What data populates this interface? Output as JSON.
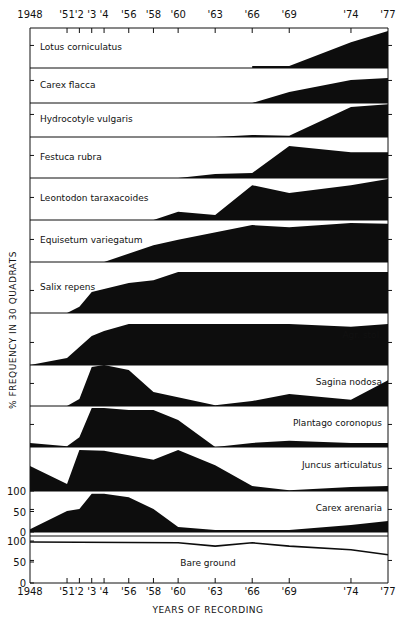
{
  "chart_data": {
    "type": "area",
    "title": "",
    "xlabel": "YEARS OF RECORDING",
    "ylabel": "% FREQUENCY IN 30 QUADRATS",
    "x_ticks": [
      {
        "year": 1948,
        "label": "1948"
      },
      {
        "year": 1951,
        "label": "'51"
      },
      {
        "year": 1952,
        "label": "'2"
      },
      {
        "year": 1953,
        "label": "'3"
      },
      {
        "year": 1954,
        "label": "'4"
      },
      {
        "year": 1956,
        "label": "'56"
      },
      {
        "year": 1958,
        "label": "'58"
      },
      {
        "year": 1960,
        "label": "'60"
      },
      {
        "year": 1963,
        "label": "'63"
      },
      {
        "year": 1966,
        "label": "'66"
      },
      {
        "year": 1969,
        "label": "'69"
      },
      {
        "year": 1974,
        "label": "'74"
      },
      {
        "year": 1977,
        "label": "'77"
      }
    ],
    "xlim": [
      1948,
      1977
    ],
    "band_ylim": [
      0,
      100
    ],
    "y_scale_labels": [
      "100",
      "50",
      "0"
    ],
    "series": [
      {
        "name": "Lotus corniculatus",
        "label_pos": "left",
        "style": "fill",
        "points": [
          [
            1966,
            5
          ],
          [
            1969,
            5
          ],
          [
            1974,
            63
          ],
          [
            1977,
            90
          ]
        ]
      },
      {
        "name": "Carex flacca",
        "label_pos": "left",
        "style": "fill",
        "points": [
          [
            1966,
            0
          ],
          [
            1969,
            27
          ],
          [
            1974,
            56
          ],
          [
            1977,
            61
          ]
        ]
      },
      {
        "name": "Hydrocotyle vulgaris",
        "label_pos": "left",
        "style": "fill",
        "points": [
          [
            1963,
            0
          ],
          [
            1966,
            5
          ],
          [
            1969,
            3
          ],
          [
            1974,
            73
          ],
          [
            1977,
            80
          ]
        ]
      },
      {
        "name": "Festuca rubra",
        "label_pos": "left",
        "style": "fill",
        "points": [
          [
            1960,
            0
          ],
          [
            1963,
            10
          ],
          [
            1966,
            12
          ],
          [
            1969,
            78
          ],
          [
            1974,
            63
          ],
          [
            1977,
            63
          ]
        ]
      },
      {
        "name": "Leontodon taraxacoides",
        "label_pos": "left",
        "style": "fill",
        "points": [
          [
            1958,
            0
          ],
          [
            1960,
            20
          ],
          [
            1963,
            12
          ],
          [
            1966,
            85
          ],
          [
            1969,
            66
          ],
          [
            1974,
            85
          ],
          [
            1977,
            100
          ]
        ]
      },
      {
        "name": "Equisetum variegatum",
        "label_pos": "left",
        "style": "fill",
        "points": [
          [
            1954,
            0
          ],
          [
            1958,
            41
          ],
          [
            1960,
            54
          ],
          [
            1966,
            90
          ],
          [
            1969,
            85
          ],
          [
            1974,
            95
          ],
          [
            1977,
            93
          ]
        ]
      },
      {
        "name": "Salix repens",
        "label_pos": "left",
        "style": "fill",
        "points": [
          [
            1951,
            0
          ],
          [
            1952,
            15
          ],
          [
            1953,
            51
          ],
          [
            1956,
            73
          ],
          [
            1958,
            80
          ],
          [
            1960,
            100
          ],
          [
            1977,
            100
          ]
        ]
      },
      {
        "name": "Agr. stol.",
        "label_pos": "right",
        "style": "fill",
        "points": [
          [
            1948,
            0
          ],
          [
            1951,
            17
          ],
          [
            1953,
            71
          ],
          [
            1954,
            83
          ],
          [
            1956,
            100
          ],
          [
            1960,
            100
          ],
          [
            1966,
            100
          ],
          [
            1969,
            100
          ],
          [
            1974,
            93
          ],
          [
            1977,
            100
          ]
        ]
      },
      {
        "name": "Sagina nodosa",
        "label_pos": "right",
        "style": "fill",
        "points": [
          [
            1951,
            0
          ],
          [
            1952,
            17
          ],
          [
            1953,
            95
          ],
          [
            1954,
            100
          ],
          [
            1956,
            88
          ],
          [
            1958,
            34
          ],
          [
            1963,
            2
          ],
          [
            1966,
            12
          ],
          [
            1969,
            29
          ],
          [
            1974,
            15
          ],
          [
            1977,
            63
          ]
        ]
      },
      {
        "name": "Plantago coronopus",
        "label_pos": "right",
        "style": "fill",
        "points": [
          [
            1948,
            10
          ],
          [
            1951,
            2
          ],
          [
            1952,
            24
          ],
          [
            1953,
            95
          ],
          [
            1954,
            95
          ],
          [
            1956,
            90
          ],
          [
            1958,
            90
          ],
          [
            1960,
            66
          ],
          [
            1963,
            0
          ],
          [
            1966,
            10
          ],
          [
            1969,
            15
          ],
          [
            1974,
            10
          ],
          [
            1977,
            10
          ]
        ]
      },
      {
        "name": "Juncus articulatus",
        "label_pos": "right",
        "style": "fill",
        "points": [
          [
            1948,
            61
          ],
          [
            1951,
            17
          ],
          [
            1952,
            100
          ],
          [
            1954,
            98
          ],
          [
            1958,
            76
          ],
          [
            1960,
            100
          ],
          [
            1963,
            63
          ],
          [
            1966,
            12
          ],
          [
            1969,
            2
          ],
          [
            1974,
            10
          ],
          [
            1977,
            12
          ]
        ]
      },
      {
        "name": "Carex arenaria",
        "label_pos": "right",
        "style": "fill",
        "points": [
          [
            1948,
            7
          ],
          [
            1951,
            51
          ],
          [
            1952,
            56
          ],
          [
            1953,
            93
          ],
          [
            1954,
            93
          ],
          [
            1956,
            85
          ],
          [
            1958,
            56
          ],
          [
            1960,
            12
          ],
          [
            1963,
            5
          ],
          [
            1966,
            5
          ],
          [
            1969,
            5
          ],
          [
            1974,
            17
          ],
          [
            1977,
            27
          ]
        ]
      },
      {
        "name": "Bare ground",
        "label_pos": "center",
        "style": "line",
        "points": [
          [
            1948,
            100
          ],
          [
            1960,
            98
          ],
          [
            1963,
            90
          ],
          [
            1966,
            98
          ],
          [
            1969,
            90
          ],
          [
            1974,
            81
          ],
          [
            1977,
            69
          ]
        ]
      }
    ],
    "grid": false,
    "legend": "inline labels"
  }
}
